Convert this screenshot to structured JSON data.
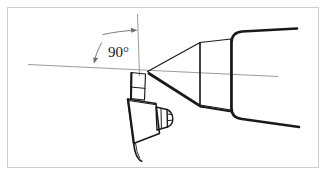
{
  "figure": {
    "caption": "",
    "background_color": "#ffffff",
    "frame_color": "#cfcfcf",
    "ink_color": "#1a1a1a",
    "construction_line_color": "#8a8a8a",
    "annotations": [
      {
        "id": "angle-90",
        "text": "90°",
        "x": 108,
        "y": 57,
        "description": "Angle between tool axis and workpiece centreline"
      }
    ],
    "leaders": [
      {
        "id": "leader-upper",
        "description": "Arrow pointing right toward the vertical tool axis",
        "from_x": 103,
        "from_y": 33,
        "to_x": 136,
        "to_y": 31
      },
      {
        "id": "leader-lower",
        "description": "Arrow pointing down-left toward the horizontal centreline",
        "from_x": 101,
        "from_y": 44,
        "to_x": 94,
        "to_y": 64
      }
    ],
    "parts": [
      {
        "id": "workpiece-cone",
        "label": "Tapered workpiece (cone)"
      },
      {
        "id": "workpiece-cylinder",
        "label": "Cylindrical shoulder"
      },
      {
        "id": "chuck-jaws",
        "label": "Chuck / holder"
      },
      {
        "id": "tool-shank",
        "label": "Tool shank"
      },
      {
        "id": "tool-body",
        "label": "Tool body"
      },
      {
        "id": "tool-connector",
        "label": "Ribbed connector"
      },
      {
        "id": "tool-tail",
        "label": "Cable tail"
      },
      {
        "id": "centre-line",
        "label": "Workpiece centreline"
      },
      {
        "id": "tool-axis-line",
        "label": "Vertical tool axis"
      }
    ]
  }
}
